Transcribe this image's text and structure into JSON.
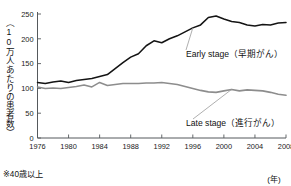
{
  "chart_data": {
    "type": "line",
    "title": "",
    "xlabel": "(年)",
    "ylabel": "（10万人あたりの患者数）",
    "footnote": "※40歳以上",
    "xlim": [
      1976,
      2008
    ],
    "ylim": [
      0,
      250
    ],
    "grid": false,
    "legend_position": "inline-callout",
    "y_ticks": [
      0,
      50,
      100,
      150,
      200,
      250
    ],
    "y_tick_labels": [
      "0",
      "50",
      "100",
      "150",
      "200",
      "250"
    ],
    "x_ticks": [
      1976,
      1980,
      1984,
      1988,
      1992,
      1996,
      2000,
      2004,
      2008
    ],
    "x_tick_labels": [
      "1976",
      "1980",
      "1984",
      "1988",
      "1992",
      "1996",
      "2000",
      "2004",
      "2008"
    ],
    "x": [
      1976,
      1977,
      1978,
      1979,
      1980,
      1981,
      1982,
      1983,
      1984,
      1985,
      1986,
      1987,
      1988,
      1989,
      1990,
      1991,
      1992,
      1993,
      1994,
      1995,
      1996,
      1997,
      1998,
      1999,
      2000,
      2001,
      2002,
      2003,
      2004,
      2005,
      2006,
      2007,
      2008
    ],
    "series": [
      {
        "name": "Early stage",
        "name_jp": "早期がん",
        "label": "Early stage（早期がん）",
        "color": "#141414",
        "values": [
          112,
          110,
          113,
          115,
          112,
          116,
          118,
          120,
          124,
          128,
          140,
          152,
          163,
          170,
          186,
          196,
          192,
          200,
          206,
          214,
          222,
          228,
          243,
          246,
          240,
          235,
          233,
          228,
          226,
          229,
          228,
          232,
          233
        ]
      },
      {
        "name": "Late stage",
        "name_jp": "進行がん",
        "label": "Late stage（進行がん）",
        "color": "#8d8d8d",
        "values": [
          103,
          100,
          101,
          100,
          102,
          104,
          107,
          103,
          112,
          106,
          108,
          110,
          110,
          110,
          111,
          111,
          112,
          110,
          108,
          104,
          100,
          96,
          93,
          92,
          95,
          98,
          95,
          97,
          96,
          95,
          92,
          88,
          86
        ]
      }
    ]
  }
}
